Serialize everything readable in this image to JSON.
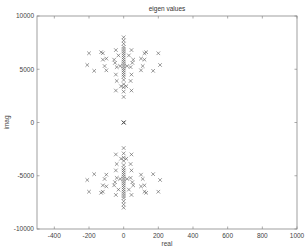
{
  "chart_data": {
    "type": "scatter",
    "title": "eigen values",
    "xlabel": "real",
    "ylabel": "imag",
    "xlim": [
      -500,
      1000
    ],
    "ylim": [
      -10000,
      10000
    ],
    "xticks": [
      -400,
      -200,
      0,
      200,
      400,
      600,
      800,
      1000
    ],
    "yticks": [
      -10000,
      -5000,
      0,
      5000,
      10000
    ],
    "xtick_labels": [
      "-400",
      "-200",
      "0",
      "200",
      "400",
      "600",
      "800",
      "1000"
    ],
    "ytick_labels": [
      "-10000",
      "-5000",
      "0",
      "5000",
      "10000"
    ],
    "grid": false,
    "legend": null,
    "marker": "x",
    "marker_color": "#555555",
    "series": [
      {
        "name": "eigenvalues",
        "points": [
          [
            0,
            0
          ],
          [
            0,
            0
          ],
          [
            0,
            0
          ],
          [
            0,
            0
          ],
          [
            -210,
            5400
          ],
          [
            -170,
            4850
          ],
          [
            -200,
            6500
          ],
          [
            -130,
            6600
          ],
          [
            -120,
            6500
          ],
          [
            -120,
            5900
          ],
          [
            -100,
            6000
          ],
          [
            -110,
            5300
          ],
          [
            -100,
            4900
          ],
          [
            -45,
            6800
          ],
          [
            -55,
            5900
          ],
          [
            -50,
            5600
          ],
          [
            -40,
            5200
          ],
          [
            -45,
            4500
          ],
          [
            -40,
            3900
          ],
          [
            -45,
            3000
          ],
          [
            -30,
            6300
          ],
          [
            -20,
            5300
          ],
          [
            -15,
            3400
          ],
          [
            210,
            5400
          ],
          [
            170,
            4850
          ],
          [
            200,
            6500
          ],
          [
            130,
            6600
          ],
          [
            120,
            6500
          ],
          [
            120,
            5900
          ],
          [
            100,
            6000
          ],
          [
            110,
            5300
          ],
          [
            100,
            4900
          ],
          [
            45,
            6800
          ],
          [
            55,
            5900
          ],
          [
            50,
            5600
          ],
          [
            40,
            5200
          ],
          [
            45,
            4500
          ],
          [
            40,
            3900
          ],
          [
            45,
            3000
          ],
          [
            30,
            6300
          ],
          [
            20,
            5300
          ],
          [
            15,
            3400
          ],
          [
            0,
            8000
          ],
          [
            0,
            7700
          ],
          [
            0,
            7400
          ],
          [
            0,
            7100
          ],
          [
            0,
            6900
          ],
          [
            0,
            6700
          ],
          [
            0,
            6500
          ],
          [
            0,
            6300
          ],
          [
            0,
            6100
          ],
          [
            0,
            5900
          ],
          [
            0,
            5700
          ],
          [
            0,
            5500
          ],
          [
            0,
            5300
          ],
          [
            0,
            5100
          ],
          [
            0,
            4900
          ],
          [
            0,
            4700
          ],
          [
            0,
            4500
          ],
          [
            0,
            4300
          ],
          [
            0,
            4000
          ],
          [
            0,
            3600
          ],
          [
            0,
            3300
          ],
          [
            0,
            2900
          ],
          [
            0,
            2400
          ],
          [
            -210,
            -5400
          ],
          [
            -170,
            -4850
          ],
          [
            -200,
            -6500
          ],
          [
            -130,
            -6600
          ],
          [
            -120,
            -6500
          ],
          [
            -120,
            -5900
          ],
          [
            -100,
            -6000
          ],
          [
            -110,
            -5300
          ],
          [
            -100,
            -4900
          ],
          [
            -45,
            -6800
          ],
          [
            -55,
            -5900
          ],
          [
            -50,
            -5600
          ],
          [
            -40,
            -5200
          ],
          [
            -45,
            -4500
          ],
          [
            -40,
            -3900
          ],
          [
            -45,
            -3000
          ],
          [
            -30,
            -6300
          ],
          [
            -20,
            -5300
          ],
          [
            -15,
            -3400
          ],
          [
            210,
            -5400
          ],
          [
            170,
            -4850
          ],
          [
            200,
            -6500
          ],
          [
            130,
            -6600
          ],
          [
            120,
            -6500
          ],
          [
            120,
            -5900
          ],
          [
            100,
            -6000
          ],
          [
            110,
            -5300
          ],
          [
            100,
            -4900
          ],
          [
            45,
            -6800
          ],
          [
            55,
            -5900
          ],
          [
            50,
            -5600
          ],
          [
            40,
            -5200
          ],
          [
            45,
            -4500
          ],
          [
            40,
            -3900
          ],
          [
            45,
            -3000
          ],
          [
            30,
            -6300
          ],
          [
            20,
            -5300
          ],
          [
            15,
            -3400
          ],
          [
            0,
            -8000
          ],
          [
            0,
            -7700
          ],
          [
            0,
            -7400
          ],
          [
            0,
            -7100
          ],
          [
            0,
            -6900
          ],
          [
            0,
            -6700
          ],
          [
            0,
            -6500
          ],
          [
            0,
            -6300
          ],
          [
            0,
            -6100
          ],
          [
            0,
            -5900
          ],
          [
            0,
            -5700
          ],
          [
            0,
            -5500
          ],
          [
            0,
            -5300
          ],
          [
            0,
            -5100
          ],
          [
            0,
            -4900
          ],
          [
            0,
            -4700
          ],
          [
            0,
            -4500
          ],
          [
            0,
            -4300
          ],
          [
            0,
            -4000
          ],
          [
            0,
            -3600
          ],
          [
            0,
            -3300
          ],
          [
            0,
            -2900
          ],
          [
            0,
            -2400
          ]
        ]
      }
    ]
  },
  "layout": {
    "plot_left": 37,
    "plot_top": 16,
    "plot_right": 297,
    "plot_bottom": 229
  }
}
